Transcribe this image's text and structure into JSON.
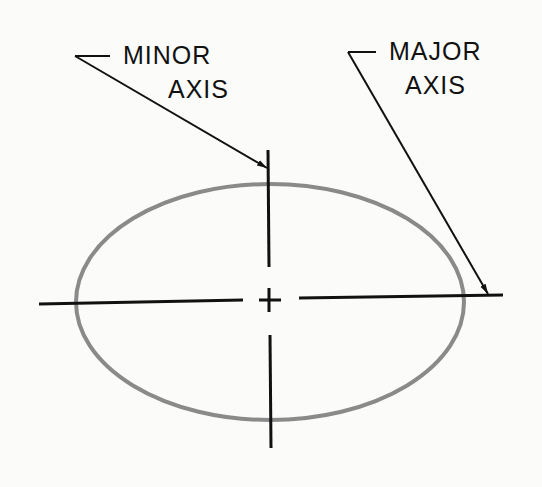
{
  "diagram": {
    "type": "ellipse-axes",
    "labels": {
      "minor_line1": "MINOR",
      "minor_line2": "AXIS",
      "major_line1": "MAJOR",
      "major_line2": "AXIS"
    },
    "colors": {
      "ellipse": "#8a8a8a",
      "lines": "#111111",
      "background": "#fbfbf9"
    }
  }
}
